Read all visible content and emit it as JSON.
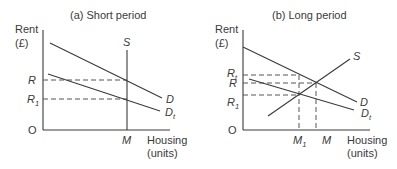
{
  "panels": [
    {
      "id": "a",
      "title": "(a) Short period",
      "y_axis_label": [
        "Rent",
        "(£)"
      ],
      "x_axis_label": [
        "Housing",
        "(units)"
      ],
      "origin_label": "O",
      "y_ticks": [
        {
          "main": "R",
          "sub": ""
        },
        {
          "main": "R",
          "sub": "1"
        }
      ],
      "x_ticks": [
        {
          "main": "M",
          "sub": ""
        }
      ],
      "curves": [
        {
          "main": "S",
          "sub": "",
          "kind": "supply",
          "shape": "vertical"
        },
        {
          "main": "D",
          "sub": "",
          "kind": "demand"
        },
        {
          "main": "D",
          "sub": "t",
          "kind": "demand"
        }
      ]
    },
    {
      "id": "b",
      "title": "(b) Long period",
      "y_axis_label": [
        "Rent",
        "(£)"
      ],
      "x_axis_label": [
        "Housing",
        "(units)"
      ],
      "origin_label": "O",
      "y_ticks": [
        {
          "main": "R",
          "sub": "t"
        },
        {
          "main": "R",
          "sub": ""
        },
        {
          "main": "R",
          "sub": "1"
        }
      ],
      "x_ticks": [
        {
          "main": "M",
          "sub": "1"
        },
        {
          "main": "M",
          "sub": ""
        }
      ],
      "curves": [
        {
          "main": "S",
          "sub": "",
          "kind": "supply",
          "shape": "upward-sloping"
        },
        {
          "main": "D",
          "sub": "",
          "kind": "demand"
        },
        {
          "main": "D",
          "sub": "t",
          "kind": "demand"
        }
      ]
    }
  ]
}
